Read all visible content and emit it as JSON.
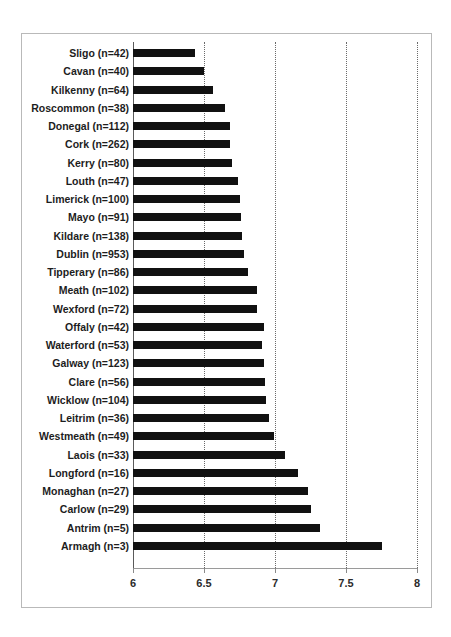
{
  "chart_data": {
    "type": "bar",
    "orientation": "horizontal",
    "title": "",
    "subtitle": "",
    "xlabel": "",
    "ylabel": "",
    "xlim": [
      6,
      8
    ],
    "xticks": [
      "6",
      "6.5",
      "7",
      "7.5",
      "8"
    ],
    "xtick_values": [
      6,
      6.5,
      7,
      7.5,
      8
    ],
    "grid": "vertical-dotted",
    "legend": "none",
    "bar_color": "#111111",
    "categories": [
      "Sligo (n=42)",
      "Cavan (n=40)",
      "Kilkenny (n=64)",
      "Roscommon (n=38)",
      "Donegal (n=112)",
      "Cork (n=262)",
      "Kerry (n=80)",
      "Louth (n=47)",
      "Limerick (n=100)",
      "Mayo (n=91)",
      "Kildare (n=138)",
      "Dublin (n=953)",
      "Tipperary (n=86)",
      "Meath (n=102)",
      "Wexford (n=72)",
      "Offaly (n=42)",
      "Waterford (n=53)",
      "Galway (n=123)",
      "Clare (n=56)",
      "Wicklow (n=104)",
      "Leitrim (n=36)",
      "Westmeath (n=49)",
      "Laois (n=33)",
      "Longford (n=16)",
      "Monaghan (n=27)",
      "Carlow (n=29)",
      "Antrim (n=5)",
      "Armagh (n=3)"
    ],
    "counts": [
      42,
      40,
      64,
      38,
      112,
      262,
      80,
      47,
      100,
      91,
      138,
      953,
      86,
      102,
      72,
      42,
      53,
      123,
      56,
      104,
      36,
      49,
      33,
      16,
      27,
      29,
      5,
      3
    ],
    "values": [
      6.44,
      6.5,
      6.56,
      6.65,
      6.68,
      6.68,
      6.7,
      6.74,
      6.75,
      6.76,
      6.77,
      6.78,
      6.81,
      6.87,
      6.87,
      6.92,
      6.91,
      6.92,
      6.93,
      6.94,
      6.96,
      6.99,
      7.07,
      7.16,
      7.23,
      7.25,
      7.32,
      7.75
    ]
  },
  "bleed_text": ""
}
